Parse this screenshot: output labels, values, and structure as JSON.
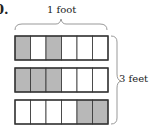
{
  "problem_label": "0.",
  "width_label": "1 foot",
  "height_label": "3 feet",
  "colors": {
    "shaded": "#b8b8b8",
    "unshaded": "#ffffff",
    "stroke": "#333333",
    "brace": "#999999"
  },
  "rows": [
    {
      "cells": [
        1,
        0,
        1,
        0,
        0,
        0
      ]
    },
    {
      "cells": [
        1,
        1,
        1,
        0,
        0,
        0
      ]
    },
    {
      "cells": [
        0,
        0,
        0,
        0,
        1,
        1
      ]
    }
  ]
}
